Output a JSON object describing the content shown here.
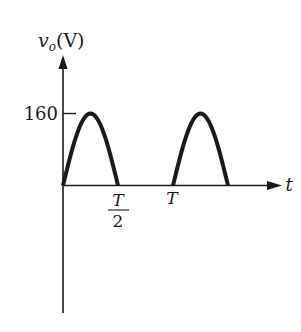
{
  "chart_data": {
    "type": "line",
    "title": "",
    "xlabel": "t",
    "ylabel": "v_o(V)",
    "ylabel_main": "v",
    "ylabel_sub": "o",
    "ylabel_unit": "(V)",
    "y_ticks": [
      {
        "value": 160,
        "label": "160"
      }
    ],
    "x_ticks": [
      {
        "value": 0.5,
        "label_num": "T",
        "label_den": "2",
        "label": "T/2"
      },
      {
        "value": 1.0,
        "label": "T"
      }
    ],
    "ylim": [
      -120,
      200
    ],
    "xlim": [
      0,
      1.8
    ],
    "grid": false,
    "legend": null,
    "series": [
      {
        "name": "half-wave rectified output",
        "description": "Positive half-cycles of a sinusoid with peak 160 V; output is zero during negative half-cycles",
        "segments": [
          {
            "t_start": 0.0,
            "t_peak": 0.25,
            "t_end": 0.5,
            "peak": 160
          },
          {
            "t_start": 1.0,
            "t_peak": 1.25,
            "t_end": 1.5,
            "peak": 160
          }
        ],
        "x": [
          0,
          0.125,
          0.25,
          0.375,
          0.5,
          1.0,
          1.125,
          1.25,
          1.375,
          1.5
        ],
        "values": [
          0,
          113,
          160,
          113,
          0,
          0,
          113,
          160,
          113,
          0
        ]
      }
    ],
    "colors": {
      "curve": "#1a1a1a",
      "axis": "#1a1a1a",
      "background": "#ffffff"
    }
  },
  "labels": {
    "y_axis_v": "v",
    "y_axis_sub": "o",
    "y_axis_unit": "(V)",
    "y_tick_160": "160",
    "x_tick_half_num": "T",
    "x_tick_half_den": "2",
    "x_tick_T": "T",
    "x_axis": "t"
  }
}
